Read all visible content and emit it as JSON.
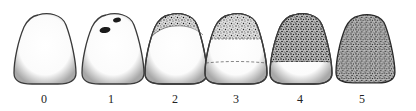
{
  "diagram": {
    "type": "tooth-stage-scale",
    "stages": [
      {
        "label": "0",
        "cx": 44,
        "stain": "none"
      },
      {
        "label": "1",
        "cx": 111,
        "stain": "spots"
      },
      {
        "label": "2",
        "cx": 175,
        "stain": "incisal-band"
      },
      {
        "label": "3",
        "cx": 236,
        "stain": "upper-third",
        "dashed_line": "middle"
      },
      {
        "label": "4",
        "cx": 300,
        "stain": "upper-two-thirds"
      },
      {
        "label": "5",
        "cx": 362,
        "stain": "full"
      }
    ],
    "colors": {
      "outline": "#3a3a3a",
      "tooth_fill": "#ffffff",
      "shade": "#b8b8b8",
      "stain": "#2a2a2a",
      "background": "#ffffff"
    }
  }
}
